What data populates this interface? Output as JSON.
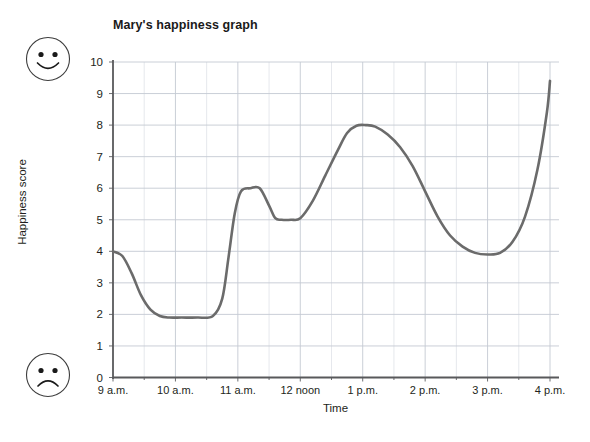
{
  "chart_data": {
    "type": "line",
    "title": "Mary's happiness graph",
    "xlabel": "Time",
    "ylabel": "Happiness score",
    "xlim": [
      9,
      16
    ],
    "ylim": [
      0,
      10
    ],
    "grid": true,
    "legend": null,
    "x_tick_labels": [
      "9 a.m.",
      "10 a.m.",
      "11 a.m.",
      "12 noon",
      "1 p.m.",
      "2 p.m.",
      "3 p.m.",
      "4 p.m."
    ],
    "x_tick_values": [
      9,
      10,
      11,
      12,
      13,
      14,
      15,
      16
    ],
    "x_minor_tick_step": 0.5,
    "y_tick_labels": [
      "0",
      "1",
      "2",
      "3",
      "4",
      "5",
      "6",
      "7",
      "8",
      "9",
      "10"
    ],
    "y_tick_values": [
      0,
      1,
      2,
      3,
      4,
      5,
      6,
      7,
      8,
      9,
      10
    ],
    "series": [
      {
        "name": "Happiness score",
        "color": "#6b6b6b",
        "line_width": 2.6,
        "x": [
          9.0,
          9.15,
          9.3,
          9.45,
          9.6,
          9.75,
          9.9,
          10.1,
          10.35,
          10.6,
          10.75,
          10.85,
          10.95,
          11.05,
          11.2,
          11.35,
          11.5,
          11.6,
          11.7,
          11.85,
          12.0,
          12.2,
          12.4,
          12.6,
          12.75,
          12.9,
          13.05,
          13.2,
          13.4,
          13.6,
          13.8,
          14.0,
          14.2,
          14.4,
          14.6,
          14.8,
          15.0,
          15.2,
          15.4,
          15.6,
          15.8,
          15.95,
          16.0
        ],
        "y": [
          4.0,
          3.85,
          3.3,
          2.6,
          2.15,
          1.95,
          1.9,
          1.9,
          1.9,
          1.95,
          2.5,
          3.8,
          5.2,
          5.9,
          6.0,
          6.0,
          5.45,
          5.05,
          5.0,
          5.0,
          5.05,
          5.6,
          6.4,
          7.2,
          7.75,
          7.98,
          8.0,
          7.95,
          7.7,
          7.3,
          6.7,
          5.9,
          5.1,
          4.5,
          4.15,
          3.95,
          3.9,
          3.95,
          4.3,
          5.1,
          6.6,
          8.4,
          9.4
        ]
      }
    ],
    "annotations": [
      {
        "name": "happy-face-icon",
        "position": "top-left",
        "meaning": "high happiness"
      },
      {
        "name": "sad-face-icon",
        "position": "bottom-left",
        "meaning": "low happiness"
      }
    ],
    "colors": {
      "line": "#6b6b6b",
      "grid": "#c9cdd6",
      "axis": "#58595b",
      "text": "#231f20",
      "background": "#ffffff"
    }
  }
}
